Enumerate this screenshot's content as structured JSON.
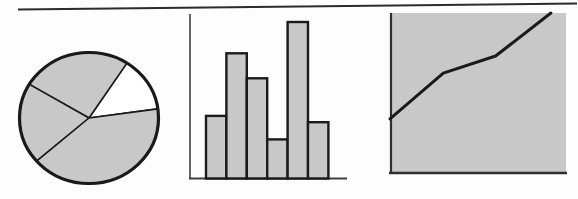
{
  "figure": {
    "background": "#fdfdfd",
    "title": ""
  },
  "colors": {
    "shape_fill": "#c8c8c8",
    "line_black": "#1a1a1a",
    "axis_gray": "#3f3f3f",
    "panel_border": "#2f2f2f",
    "rule_color": "#2b2b2b",
    "white": "#ffffff"
  },
  "top_rule": {
    "present": true,
    "tilted": true
  },
  "chart_data": [
    {
      "type": "pie",
      "title": "",
      "legend": false,
      "data_labels": false,
      "slices": [
        {
          "label": "white-slice",
          "percent": 13.6,
          "fill": "white",
          "start_angle_deg": 8
        },
        {
          "label": "top-slice",
          "percent": 25.6,
          "fill": "gray"
        },
        {
          "label": "left-slice",
          "percent": 20.0,
          "fill": "gray"
        },
        {
          "label": "bottom-slice",
          "percent": 40.8,
          "fill": "gray"
        }
      ]
    },
    {
      "type": "bar",
      "title": "",
      "categories": [
        "1",
        "2",
        "3",
        "4",
        "5",
        "6"
      ],
      "values": [
        4.0,
        8.0,
        6.4,
        2.5,
        10.0,
        3.6
      ],
      "ylim": [
        0,
        10.5
      ],
      "xlabel": "",
      "ylabel": "",
      "grid": false,
      "tick_labels": false
    },
    {
      "type": "line",
      "title": "",
      "filled_background": true,
      "x_percent": [
        0,
        30.3,
        60.0,
        91.4
      ],
      "y_percent": [
        34.2,
        62.7,
        73.3,
        100
      ],
      "xlabel": "",
      "ylabel": "",
      "grid": false,
      "tick_labels": false
    }
  ]
}
